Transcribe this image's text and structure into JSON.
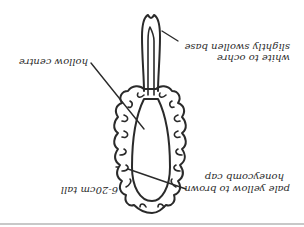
{
  "diagram": {
    "orientation": "rotated 180 degrees",
    "labels": {
      "size": "6-20cm tall",
      "cap_line1": "pale yellow to brown",
      "cap_line2": "honeycomb cap",
      "centre": "hollow centre",
      "stem_line1": "white to ochre",
      "stem_line2": "slightly swollen base"
    },
    "colors": {
      "ink": "#2a2a2a",
      "background": "#ffffff",
      "rule": "#c8c8c8"
    }
  }
}
